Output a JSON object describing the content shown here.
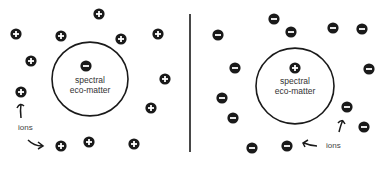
{
  "panels": [
    {
      "id": "left",
      "center_label_line1": "spectral",
      "center_label_line2": "eco-matter",
      "center_charge": "-",
      "ion_charge": "+",
      "ions_label": "ions",
      "circle": {
        "cx": 90,
        "cy": 79,
        "r": 38
      },
      "center_ion": {
        "x": 86,
        "y": 66
      },
      "ions": [
        {
          "x": 99,
          "y": 14
        },
        {
          "x": 16,
          "y": 34
        },
        {
          "x": 61,
          "y": 36
        },
        {
          "x": 121,
          "y": 39
        },
        {
          "x": 158,
          "y": 34
        },
        {
          "x": 31,
          "y": 61
        },
        {
          "x": 165,
          "y": 79
        },
        {
          "x": 21,
          "y": 92
        },
        {
          "x": 151,
          "y": 108
        },
        {
          "x": 61,
          "y": 146
        },
        {
          "x": 89,
          "y": 142
        },
        {
          "x": 134,
          "y": 144
        }
      ]
    },
    {
      "id": "right",
      "center_label_line1": "spectral",
      "center_label_line2": "eco-matter",
      "center_charge": "+",
      "ion_charge": "-",
      "ions_label": "ions",
      "circle": {
        "cx": 295,
        "cy": 86,
        "r": 39
      },
      "center_ion": {
        "x": 295,
        "y": 68
      },
      "ions": [
        {
          "x": 274,
          "y": 19
        },
        {
          "x": 218,
          "y": 35
        },
        {
          "x": 291,
          "y": 32
        },
        {
          "x": 333,
          "y": 28
        },
        {
          "x": 362,
          "y": 29
        },
        {
          "x": 235,
          "y": 68
        },
        {
          "x": 369,
          "y": 69
        },
        {
          "x": 222,
          "y": 98
        },
        {
          "x": 233,
          "y": 118
        },
        {
          "x": 252,
          "y": 148
        },
        {
          "x": 287,
          "y": 146
        },
        {
          "x": 347,
          "y": 107
        },
        {
          "x": 364,
          "y": 127
        }
      ]
    }
  ],
  "colors": {
    "ion_fill": "#1a1a1a",
    "ion_symbol": "#ffffff",
    "stroke": "#1a1a1a",
    "text": "#333333"
  }
}
